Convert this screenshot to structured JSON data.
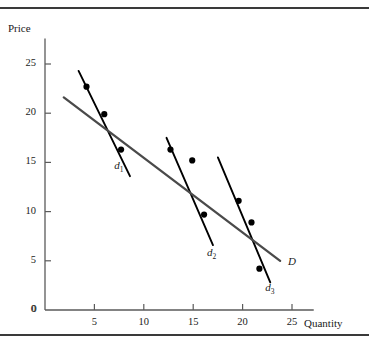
{
  "figure": {
    "name": "demand-curves-scatter",
    "border_color": "#3a3a3a",
    "background": "#ffffff"
  },
  "chart_data": {
    "type": "scatter",
    "title": "",
    "subtitle": "",
    "xlabel": "Quantity",
    "ylabel": "Price",
    "xlim": [
      0,
      27
    ],
    "ylim": [
      0,
      28
    ],
    "xticks": [
      0,
      5,
      10,
      15,
      20,
      25
    ],
    "yticks": [
      0,
      5,
      10,
      15,
      20,
      25
    ],
    "xtick_labels": [
      "0",
      "5",
      "10",
      "15",
      "20",
      "25"
    ],
    "ytick_labels": [
      "0",
      "5",
      "10",
      "15",
      "20",
      "25"
    ],
    "grid": false,
    "legend": "none",
    "axis_color": "#5a5a5a",
    "point_color": "#000000",
    "line_color": "#000000",
    "regression_color": "#4a4a4a",
    "points": [
      {
        "x": 4.2,
        "y": 22.7,
        "group": "d1"
      },
      {
        "x": 6.0,
        "y": 19.9,
        "group": "d1"
      },
      {
        "x": 7.7,
        "y": 16.3,
        "group": "d1"
      },
      {
        "x": 12.7,
        "y": 16.3,
        "group": "d2"
      },
      {
        "x": 14.9,
        "y": 15.2,
        "group": "d2"
      },
      {
        "x": 16.1,
        "y": 9.7,
        "group": "d2"
      },
      {
        "x": 19.6,
        "y": 11.1,
        "group": "d3"
      },
      {
        "x": 20.9,
        "y": 8.9,
        "group": "d3"
      },
      {
        "x": 21.7,
        "y": 4.2,
        "group": "d3"
      }
    ],
    "series": [
      {
        "name": "d1",
        "label": "d",
        "subscript": "1",
        "kind": "short-run-demand",
        "x": [
          3.4,
          8.6
        ],
        "y": [
          24.3,
          13.6
        ],
        "label_position": {
          "x": 7.0,
          "y": 14.6
        }
      },
      {
        "name": "d2",
        "label": "d",
        "subscript": "2",
        "kind": "short-run-demand",
        "x": [
          12.3,
          17.0
        ],
        "y": [
          17.5,
          6.6
        ],
        "label_position": {
          "x": 16.4,
          "y": 5.8
        }
      },
      {
        "name": "d3",
        "label": "d",
        "subscript": "3",
        "kind": "short-run-demand",
        "x": [
          17.5,
          22.8
        ],
        "y": [
          15.5,
          2.8
        ],
        "label_position": {
          "x": 22.3,
          "y": 2.2
        }
      },
      {
        "name": "D",
        "label": "D",
        "subscript": "",
        "kind": "long-run-demand",
        "x": [
          1.9,
          23.8
        ],
        "y": [
          21.6,
          5.0
        ],
        "label_position": {
          "x": 24.6,
          "y": 4.9
        }
      }
    ]
  }
}
